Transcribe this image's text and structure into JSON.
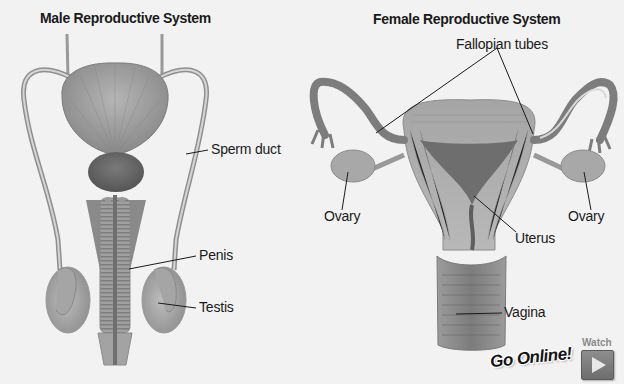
{
  "male": {
    "title": "Male Reproductive System",
    "labels": {
      "sperm_duct": "Sperm duct",
      "penis": "Penis",
      "testis": "Testis"
    }
  },
  "female": {
    "title": "Female Reproductive System",
    "labels": {
      "fallopian_tubes": "Fallopian tubes",
      "ovary_left": "Ovary",
      "ovary_right": "Ovary",
      "uterus": "Uterus",
      "vagina": "Vagina"
    }
  },
  "online": {
    "go_online": "Go Online!",
    "watch": "Watch",
    "play_icon": "play-icon"
  },
  "colors": {
    "background": "#f2f2f2",
    "organ_fill": "#9a9a9a",
    "organ_dark": "#6e6e6e",
    "label_text": "#1a1a1a",
    "watch_button": "#7d7d7d"
  }
}
